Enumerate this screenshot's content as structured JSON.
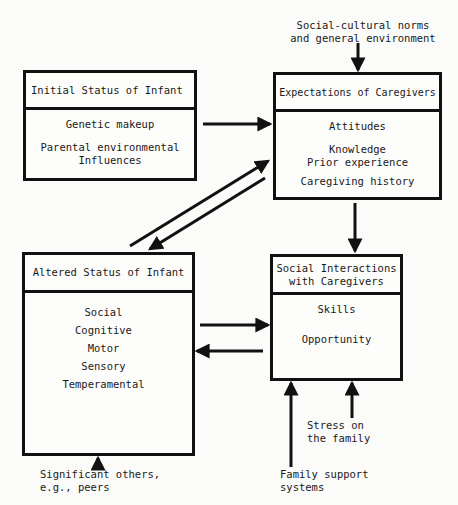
{
  "boxes": {
    "initial_status": {
      "title": "Initial Status of Infant",
      "items": [
        "Genetic makeup",
        "Parental environmental\nInfluences"
      ]
    },
    "expectations": {
      "title": "Expectations of Caregivers",
      "items": [
        "Attitudes",
        "Knowledge\nPrior experience",
        "Caregiving history"
      ]
    },
    "altered_status": {
      "title": "Altered Status of Infant",
      "items": [
        "Social",
        "Cognitive",
        "Motor",
        "Sensory",
        "Temperamental"
      ]
    },
    "social_interactions": {
      "title": "Social Interactions\nwith Caregivers",
      "items": [
        "Skills",
        "Opportunity"
      ]
    }
  },
  "external_inputs": {
    "social_cultural": "Social-cultural norms\nand general environment",
    "significant_others": "Significant others,\ne.g., peers",
    "stress": "Stress on\nthe family",
    "family_support": "Family support\nsystems"
  },
  "colors": {
    "ink": "#111111",
    "paper": "#fbfbf9"
  }
}
